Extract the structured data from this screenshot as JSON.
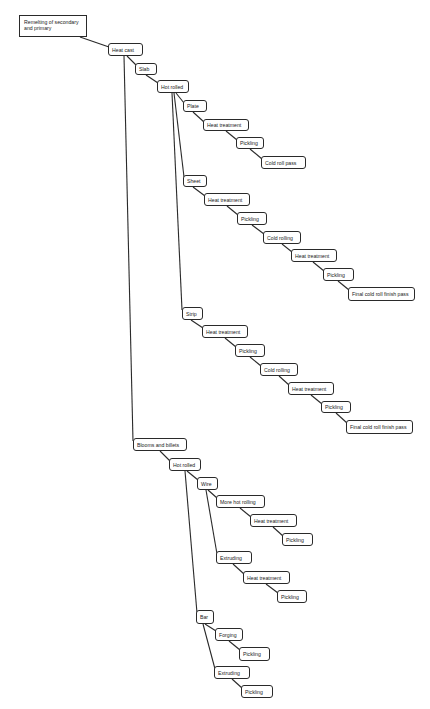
{
  "diagram": {
    "type": "process-flow-tree",
    "nodes": [
      {
        "id": "n0",
        "label": "Remelting of secondary and primary",
        "x": 19,
        "y": 15,
        "w": 68,
        "h": 22,
        "root": true
      },
      {
        "id": "n1",
        "label": "Heat cast",
        "x": 108,
        "y": 43,
        "w": 35,
        "h": 13
      },
      {
        "id": "n2",
        "label": "Slab",
        "x": 135,
        "y": 63,
        "w": 22,
        "h": 12
      },
      {
        "id": "n3",
        "label": "Hot rolled",
        "x": 157,
        "y": 80,
        "w": 32,
        "h": 13
      },
      {
        "id": "n4",
        "label": "Plate",
        "x": 183,
        "y": 100,
        "w": 24,
        "h": 12
      },
      {
        "id": "n5",
        "label": "Heat treatment",
        "x": 203,
        "y": 119,
        "w": 46,
        "h": 12
      },
      {
        "id": "n6",
        "label": "Pickling",
        "x": 236,
        "y": 137,
        "w": 28,
        "h": 12
      },
      {
        "id": "n7",
        "label": "Cold roll pass",
        "x": 261,
        "y": 156,
        "w": 45,
        "h": 13
      },
      {
        "id": "n8",
        "label": "Sheet",
        "x": 183,
        "y": 175,
        "w": 24,
        "h": 12
      },
      {
        "id": "n9",
        "label": "Heat treatment",
        "x": 204,
        "y": 193,
        "w": 46,
        "h": 13
      },
      {
        "id": "n10",
        "label": "Pickling",
        "x": 237,
        "y": 212,
        "w": 30,
        "h": 13
      },
      {
        "id": "n11",
        "label": "Cold rolling",
        "x": 263,
        "y": 231,
        "w": 38,
        "h": 13
      },
      {
        "id": "n12",
        "label": "Heat treatment",
        "x": 291,
        "y": 249,
        "w": 46,
        "h": 13
      },
      {
        "id": "n13",
        "label": "Pickling",
        "x": 323,
        "y": 268,
        "w": 31,
        "h": 13
      },
      {
        "id": "n14",
        "label": "Final cold roll finish pass",
        "x": 348,
        "y": 287,
        "w": 67,
        "h": 14
      },
      {
        "id": "n15",
        "label": "Strip",
        "x": 182,
        "y": 307,
        "w": 21,
        "h": 13
      },
      {
        "id": "n16",
        "label": "Heat treatment",
        "x": 202,
        "y": 325,
        "w": 46,
        "h": 13
      },
      {
        "id": "n17",
        "label": "Pickling",
        "x": 235,
        "y": 344,
        "w": 30,
        "h": 13
      },
      {
        "id": "n18",
        "label": "Cold rolling",
        "x": 260,
        "y": 363,
        "w": 38,
        "h": 13
      },
      {
        "id": "n19",
        "label": "Heat treatment",
        "x": 288,
        "y": 382,
        "w": 46,
        "h": 13
      },
      {
        "id": "n20",
        "label": "Pickling",
        "x": 321,
        "y": 401,
        "w": 30,
        "h": 12
      },
      {
        "id": "n21",
        "label": "Final cold roll finish pass",
        "x": 346,
        "y": 420,
        "w": 67,
        "h": 14
      },
      {
        "id": "n22",
        "label": "Blooms and billets",
        "x": 133,
        "y": 438,
        "w": 54,
        "h": 13
      },
      {
        "id": "n23",
        "label": "Hot rolled",
        "x": 169,
        "y": 458,
        "w": 32,
        "h": 13
      },
      {
        "id": "n24",
        "label": "Wire",
        "x": 197,
        "y": 477,
        "w": 21,
        "h": 13
      },
      {
        "id": "n25",
        "label": "More hot rolling",
        "x": 216,
        "y": 495,
        "w": 49,
        "h": 13
      },
      {
        "id": "n26",
        "label": "Heat treatment",
        "x": 250,
        "y": 514,
        "w": 47,
        "h": 13
      },
      {
        "id": "n27",
        "label": "Pickling",
        "x": 282,
        "y": 533,
        "w": 31,
        "h": 13
      },
      {
        "id": "n28",
        "label": "Extruding",
        "x": 216,
        "y": 551,
        "w": 36,
        "h": 13
      },
      {
        "id": "n29",
        "label": "Heat treatment",
        "x": 243,
        "y": 571,
        "w": 47,
        "h": 13
      },
      {
        "id": "n30",
        "label": "Pickling",
        "x": 277,
        "y": 590,
        "w": 30,
        "h": 13
      },
      {
        "id": "n31",
        "label": "Bar",
        "x": 196,
        "y": 610,
        "w": 18,
        "h": 14
      },
      {
        "id": "n32",
        "label": "Forging",
        "x": 215,
        "y": 628,
        "w": 28,
        "h": 13
      },
      {
        "id": "n33",
        "label": "Pickling",
        "x": 239,
        "y": 647,
        "w": 31,
        "h": 14
      },
      {
        "id": "n34",
        "label": "Extruding",
        "x": 214,
        "y": 666,
        "w": 36,
        "h": 13
      },
      {
        "id": "n35",
        "label": "Pickling",
        "x": 241,
        "y": 685,
        "w": 32,
        "h": 13
      }
    ],
    "edges": [
      {
        "from": "n0",
        "to": "n1",
        "x1": 80,
        "y1": 37,
        "x2": 109,
        "y2": 47
      },
      {
        "from": "n1",
        "to": "n2",
        "x1": 127,
        "y1": 56,
        "x2": 136,
        "y2": 65
      },
      {
        "from": "n1",
        "to": "n22",
        "x1": 124,
        "y1": 56,
        "x2": 133,
        "y2": 441
      },
      {
        "from": "n2",
        "to": "n3",
        "x1": 146,
        "y1": 75,
        "x2": 158,
        "y2": 83
      },
      {
        "from": "n3",
        "to": "n4",
        "x1": 176,
        "y1": 93,
        "x2": 184,
        "y2": 103
      },
      {
        "from": "n3",
        "to": "n8",
        "x1": 174,
        "y1": 93,
        "x2": 184,
        "y2": 177
      },
      {
        "from": "n3",
        "to": "n15",
        "x1": 172,
        "y1": 93,
        "x2": 182,
        "y2": 310
      },
      {
        "from": "n4",
        "to": "n5",
        "x1": 193,
        "y1": 112,
        "x2": 204,
        "y2": 122
      },
      {
        "from": "n5",
        "to": "n6",
        "x1": 226,
        "y1": 131,
        "x2": 237,
        "y2": 140
      },
      {
        "from": "n6",
        "to": "n7",
        "x1": 250,
        "y1": 149,
        "x2": 262,
        "y2": 159
      },
      {
        "from": "n8",
        "to": "n9",
        "x1": 193,
        "y1": 187,
        "x2": 205,
        "y2": 196
      },
      {
        "from": "n9",
        "to": "n10",
        "x1": 227,
        "y1": 206,
        "x2": 238,
        "y2": 215
      },
      {
        "from": "n10",
        "to": "n11",
        "x1": 252,
        "y1": 225,
        "x2": 264,
        "y2": 234
      },
      {
        "from": "n11",
        "to": "n12",
        "x1": 282,
        "y1": 244,
        "x2": 292,
        "y2": 252
      },
      {
        "from": "n12",
        "to": "n13",
        "x1": 313,
        "y1": 262,
        "x2": 324,
        "y2": 271
      },
      {
        "from": "n13",
        "to": "n14",
        "x1": 338,
        "y1": 281,
        "x2": 349,
        "y2": 290
      },
      {
        "from": "n15",
        "to": "n16",
        "x1": 191,
        "y1": 320,
        "x2": 203,
        "y2": 328
      },
      {
        "from": "n16",
        "to": "n17",
        "x1": 225,
        "y1": 338,
        "x2": 236,
        "y2": 347
      },
      {
        "from": "n17",
        "to": "n18",
        "x1": 250,
        "y1": 357,
        "x2": 261,
        "y2": 366
      },
      {
        "from": "n18",
        "to": "n19",
        "x1": 279,
        "y1": 376,
        "x2": 289,
        "y2": 385
      },
      {
        "from": "n19",
        "to": "n20",
        "x1": 311,
        "y1": 395,
        "x2": 322,
        "y2": 404
      },
      {
        "from": "n20",
        "to": "n21",
        "x1": 336,
        "y1": 413,
        "x2": 347,
        "y2": 423
      },
      {
        "from": "n22",
        "to": "n23",
        "x1": 160,
        "y1": 451,
        "x2": 170,
        "y2": 461
      },
      {
        "from": "n23",
        "to": "n24",
        "x1": 187,
        "y1": 471,
        "x2": 198,
        "y2": 480
      },
      {
        "from": "n23",
        "to": "n31",
        "x1": 185,
        "y1": 471,
        "x2": 197,
        "y2": 613
      },
      {
        "from": "n24",
        "to": "n25",
        "x1": 208,
        "y1": 490,
        "x2": 217,
        "y2": 498
      },
      {
        "from": "n24",
        "to": "n28",
        "x1": 206,
        "y1": 490,
        "x2": 217,
        "y2": 554
      },
      {
        "from": "n25",
        "to": "n26",
        "x1": 240,
        "y1": 508,
        "x2": 251,
        "y2": 517
      },
      {
        "from": "n26",
        "to": "n27",
        "x1": 273,
        "y1": 527,
        "x2": 283,
        "y2": 536
      },
      {
        "from": "n28",
        "to": "n29",
        "x1": 233,
        "y1": 564,
        "x2": 244,
        "y2": 574
      },
      {
        "from": "n29",
        "to": "n30",
        "x1": 266,
        "y1": 584,
        "x2": 278,
        "y2": 593
      },
      {
        "from": "n31",
        "to": "n32",
        "x1": 205,
        "y1": 624,
        "x2": 216,
        "y2": 631
      },
      {
        "from": "n31",
        "to": "n34",
        "x1": 203,
        "y1": 624,
        "x2": 215,
        "y2": 669
      },
      {
        "from": "n32",
        "to": "n33",
        "x1": 229,
        "y1": 641,
        "x2": 240,
        "y2": 650
      },
      {
        "from": "n34",
        "to": "n35",
        "x1": 232,
        "y1": 679,
        "x2": 242,
        "y2": 688
      }
    ]
  }
}
